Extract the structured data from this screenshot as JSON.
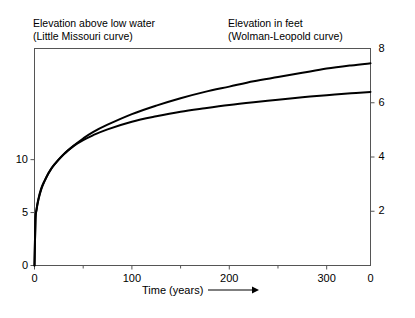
{
  "headings": {
    "left_line1": "Elevation above low water",
    "left_line2": "(Little Missouri curve)",
    "right_line1": "Elevation in feet",
    "right_line2": "(Wolman-Leopold curve)"
  },
  "axis_title": {
    "x": "Time (years)",
    "arrow_icon": "right-arrow-icon"
  },
  "chart_data": {
    "type": "line",
    "title": "",
    "subtitle": "",
    "xlabel": "Time (years)",
    "ylabel": "Elevation above low water (Little Missouri curve)",
    "y2label": "Elevation in feet (Wolman-Leopold curve)",
    "grid": false,
    "legend": "none",
    "xlim": [
      0,
      345
    ],
    "ylim": [
      0,
      20.5
    ],
    "y2lim": [
      0,
      8
    ],
    "xticks": [
      0,
      100,
      200,
      300
    ],
    "xtick_labels": [
      "0",
      "100",
      "200",
      "300"
    ],
    "xminorticks": [
      50,
      150,
      250
    ],
    "yticks": [
      0,
      5,
      10
    ],
    "ytick_labels": [
      "0",
      "5",
      "10"
    ],
    "y2ticks": [
      0,
      2,
      4,
      6,
      8
    ],
    "y2tick_labels": [
      "0",
      "2",
      "4",
      "6",
      "8"
    ],
    "series": [
      {
        "name": "Little Missouri curve",
        "axis": "left",
        "units": "elevation above low water",
        "x": [
          0,
          1,
          2,
          4,
          7,
          10,
          15,
          20,
          30,
          40,
          50,
          60,
          75,
          100,
          125,
          150,
          175,
          200,
          225,
          250,
          275,
          300,
          325,
          345
        ],
        "values": [
          0.0,
          4.3,
          5.2,
          6.2,
          7.2,
          7.9,
          8.8,
          9.5,
          10.5,
          11.3,
          12.0,
          12.6,
          13.3,
          14.3,
          15.1,
          15.8,
          16.4,
          16.9,
          17.4,
          17.8,
          18.2,
          18.6,
          18.9,
          19.1
        ]
      },
      {
        "name": "Wolman-Leopold curve",
        "axis": "right",
        "units": "feet",
        "x": [
          0,
          1,
          2,
          4,
          7,
          10,
          15,
          20,
          30,
          40,
          50,
          60,
          75,
          100,
          125,
          150,
          175,
          200,
          225,
          250,
          275,
          300,
          325,
          345
        ],
        "values": [
          0.0,
          1.7,
          2.05,
          2.45,
          2.85,
          3.1,
          3.45,
          3.7,
          4.1,
          4.4,
          4.62,
          4.8,
          5.02,
          5.3,
          5.5,
          5.67,
          5.8,
          5.92,
          6.02,
          6.11,
          6.2,
          6.28,
          6.35,
          6.4
        ]
      }
    ],
    "annotations": [
      "Both curves rise steeply from the origin and flatten with time",
      "The two traces nearly coincide for the first ~60 years then diverge"
    ]
  },
  "style": {
    "line_color": "#000000",
    "axis_color": "#555555",
    "background": "#ffffff"
  }
}
